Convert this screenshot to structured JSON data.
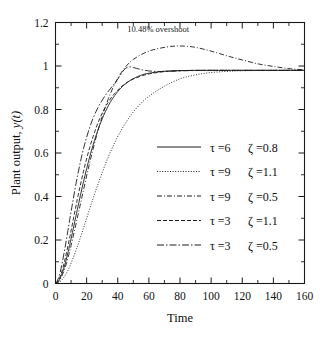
{
  "chart_data": {
    "type": "line",
    "title": "",
    "xlabel": "Time",
    "ylabel": "Plant output, y(t)",
    "ylabel_prefix": "Plant output, ",
    "ylabel_italic": "y(t)",
    "xlim": [
      0,
      160
    ],
    "ylim": [
      0,
      1.2
    ],
    "xticks": [
      0,
      20,
      40,
      60,
      80,
      100,
      120,
      140,
      160
    ],
    "xtick_labels": [
      "0",
      "20",
      "40",
      "60",
      "80",
      "100",
      "120",
      "140",
      "160"
    ],
    "xminor_step": 10,
    "yticks": [
      0,
      0.2,
      0.4,
      0.6,
      0.8,
      1,
      1.2
    ],
    "ytick_labels": [
      "0",
      "0.2",
      "0.4",
      "0.6",
      "0.8",
      "1",
      "1.2"
    ],
    "yminor_step": 0.1,
    "grid": false,
    "legend_position": "center-right",
    "annotations": [
      {
        "text": "10.48% overshoot",
        "x": 66,
        "y": 1.155,
        "points_to_x": 72,
        "points_to_y": 1.1
      }
    ],
    "series": [
      {
        "name": "tau=6  zeta=0.8",
        "tau": 6,
        "zeta": 0.8,
        "linestyle": "solid",
        "dasharray": "",
        "legend_tau_label": "τ =6",
        "legend_zeta_label": "ζ =0.8",
        "x": [
          0,
          2,
          4,
          6,
          8,
          10,
          14,
          18,
          22,
          26,
          30,
          34,
          38,
          42,
          46,
          50,
          56,
          62,
          70,
          80,
          90,
          100,
          110,
          120,
          140,
          160
        ],
        "y": [
          0.0,
          0.012,
          0.042,
          0.086,
          0.142,
          0.205,
          0.339,
          0.468,
          0.583,
          0.679,
          0.757,
          0.818,
          0.864,
          0.899,
          0.924,
          0.942,
          0.96,
          0.969,
          0.976,
          0.979,
          0.98,
          0.98,
          0.98,
          0.98,
          0.98,
          0.98
        ]
      },
      {
        "name": "tau=9  zeta=1.1",
        "tau": 9,
        "zeta": 1.1,
        "linestyle": "dotted",
        "dasharray": "1,1.6",
        "legend_tau_label": "τ =9",
        "legend_zeta_label": "ζ =1.1",
        "x": [
          0,
          2,
          4,
          6,
          8,
          10,
          14,
          18,
          22,
          26,
          30,
          34,
          38,
          42,
          46,
          50,
          56,
          62,
          70,
          80,
          90,
          100,
          110,
          120,
          140,
          160
        ],
        "y": [
          0.0,
          0.004,
          0.016,
          0.035,
          0.061,
          0.093,
          0.169,
          0.255,
          0.344,
          0.43,
          0.51,
          0.583,
          0.647,
          0.702,
          0.749,
          0.789,
          0.836,
          0.871,
          0.907,
          0.941,
          0.959,
          0.97,
          0.975,
          0.978,
          0.98,
          0.98
        ]
      },
      {
        "name": "tau=9  zeta=0.5",
        "tau": 9,
        "zeta": 0.5,
        "linestyle": "dashdot",
        "dasharray": "5,2,1,2",
        "legend_tau_label": "τ =9",
        "legend_zeta_label": "ζ =0.5",
        "x": [
          0,
          2,
          4,
          6,
          8,
          10,
          14,
          18,
          22,
          26,
          30,
          34,
          38,
          42,
          46,
          50,
          56,
          62,
          68,
          74,
          80,
          88,
          96,
          104,
          112,
          120,
          130,
          140,
          150,
          160
        ],
        "y": [
          0.0,
          0.009,
          0.033,
          0.07,
          0.118,
          0.174,
          0.3,
          0.43,
          0.556,
          0.669,
          0.768,
          0.85,
          0.916,
          0.967,
          1.004,
          1.03,
          1.056,
          1.073,
          1.083,
          1.09,
          1.092,
          1.088,
          1.076,
          1.06,
          1.043,
          1.028,
          1.01,
          0.998,
          0.988,
          0.982
        ]
      },
      {
        "name": "tau=3  zeta=1.1",
        "tau": 3,
        "zeta": 1.1,
        "linestyle": "dashed",
        "dasharray": "4,2",
        "legend_tau_label": "τ =3",
        "legend_zeta_label": "ζ =1.1",
        "x": [
          0,
          2,
          4,
          6,
          8,
          10,
          14,
          18,
          22,
          26,
          30,
          34,
          38,
          42,
          46,
          50,
          56,
          62,
          70,
          80,
          90,
          100,
          110,
          120,
          140,
          160
        ],
        "y": [
          0.0,
          0.016,
          0.054,
          0.108,
          0.173,
          0.243,
          0.386,
          0.516,
          0.626,
          0.714,
          0.783,
          0.835,
          0.874,
          0.903,
          0.924,
          0.94,
          0.956,
          0.966,
          0.974,
          0.978,
          0.98,
          0.98,
          0.98,
          0.98,
          0.98,
          0.98
        ]
      },
      {
        "name": "tau=3  zeta=0.5",
        "tau": 3,
        "zeta": 0.5,
        "linestyle": "longdashdot",
        "dasharray": "7,2,1.5,2",
        "legend_tau_label": "τ =3",
        "legend_zeta_label": "ζ =0.5",
        "x": [
          0,
          2,
          4,
          6,
          8,
          10,
          14,
          18,
          22,
          26,
          30,
          34,
          38,
          41,
          44,
          47,
          50,
          56,
          62,
          70,
          80,
          90,
          100,
          110,
          120,
          140,
          160
        ],
        "y": [
          0.0,
          0.026,
          0.084,
          0.16,
          0.244,
          0.33,
          0.49,
          0.62,
          0.718,
          0.79,
          0.843,
          0.884,
          0.92,
          0.95,
          0.982,
          0.996,
          0.993,
          0.982,
          0.976,
          0.975,
          0.978,
          0.979,
          0.98,
          0.98,
          0.98,
          0.98,
          0.98
        ]
      }
    ]
  },
  "legend": {
    "entries": [
      {
        "tau": "τ =6",
        "zeta": "ζ =0.8"
      },
      {
        "tau": "τ =9",
        "zeta": "ζ =1.1"
      },
      {
        "tau": "τ =9",
        "zeta": "ζ =0.5"
      },
      {
        "tau": "τ =3",
        "zeta": "ζ =1.1"
      },
      {
        "tau": "τ =3",
        "zeta": "ζ =0.5"
      }
    ]
  }
}
